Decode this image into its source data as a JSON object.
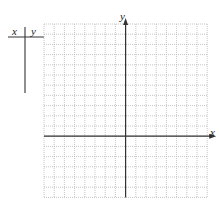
{
  "table": {
    "headers": [
      "x",
      "y"
    ],
    "rows": []
  },
  "graph": {
    "x_axis_label": "x",
    "y_axis_label": "y",
    "grid": {
      "columns": 16,
      "rows": 17,
      "spacing_px": 10.2
    },
    "colors": {
      "grid": "#b8b8b8",
      "axis": "#333333"
    }
  }
}
